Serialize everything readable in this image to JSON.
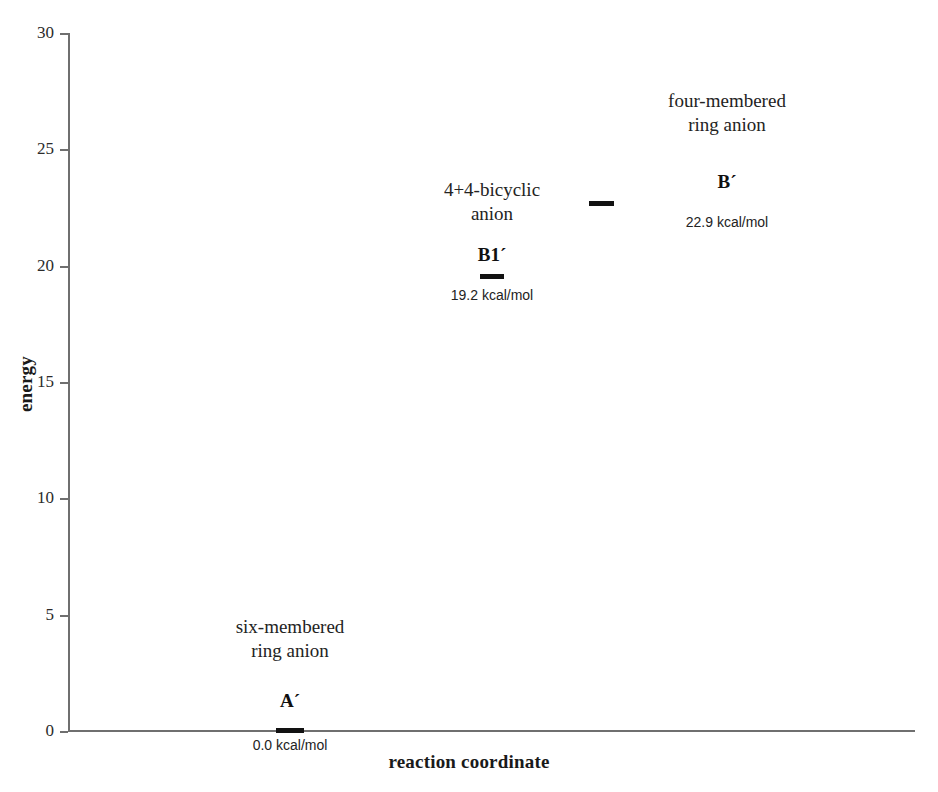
{
  "chart_data": {
    "type": "bar",
    "title": "",
    "xlabel": "reaction coordinate",
    "ylabel": "energy",
    "ylim": [
      0,
      30
    ],
    "yticks": [
      "0",
      "5",
      "10",
      "15",
      "20",
      "25",
      "30"
    ],
    "grid": false,
    "legend": "none",
    "units": "kcal/mol",
    "categories": [
      "A",
      "B1´",
      "B´"
    ],
    "values": [
      0.0,
      19.2,
      22.9
    ],
    "states": [
      {
        "symbol": "A´",
        "symbol_base": "A",
        "name_line1": "six-membered",
        "name_line2": "ring anion",
        "value": 0.0,
        "value_label": "0.0 kcal/mol"
      },
      {
        "symbol": "B1´",
        "symbol_base": "B1",
        "name_line1": "4+4-bicyclic",
        "name_line2": "anion",
        "value": 19.2,
        "value_label": "19.2 kcal/mol"
      },
      {
        "symbol": "B´",
        "symbol_base": "B",
        "name_line1": "four-membered",
        "name_line2": "ring anion",
        "value": 22.9,
        "value_label": "22.9 kcal/mol"
      }
    ],
    "colors": {
      "axis": "#6f6f6f",
      "level": "#121212",
      "text": "#232323",
      "background": "#ffffff"
    }
  }
}
